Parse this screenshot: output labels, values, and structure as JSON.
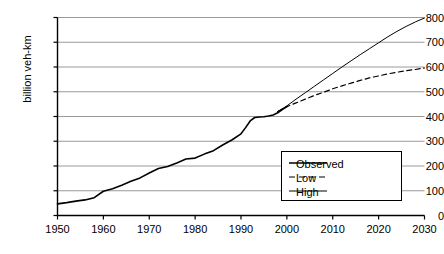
{
  "chart_data": {
    "type": "line",
    "title": "",
    "xlabel": "",
    "ylabel": "billion veh-km",
    "xlim": [
      1950,
      2030
    ],
    "ylim": [
      0,
      800
    ],
    "grid": "horizontal",
    "legend_position": "bottom-right",
    "xticks": [
      "1950",
      "1960",
      "1970",
      "1980",
      "1990",
      "2000",
      "2010",
      "2020",
      "2030"
    ],
    "xtick_values": [
      1950,
      1960,
      1970,
      1980,
      1990,
      2000,
      2010,
      2020,
      2030
    ],
    "yticks": [
      "0",
      "100",
      "200",
      "300",
      "400",
      "500",
      "600",
      "700",
      "800"
    ],
    "ytick_values": [
      0,
      100,
      200,
      300,
      400,
      500,
      600,
      700,
      800
    ],
    "series": [
      {
        "name": "Observed",
        "style": "solid",
        "width": 1.6,
        "color": "#000000",
        "x": [
          1950,
          1952,
          1954,
          1956,
          1958,
          1960,
          1962,
          1964,
          1966,
          1968,
          1970,
          1972,
          1974,
          1976,
          1978,
          1980,
          1982,
          1984,
          1986,
          1988,
          1990,
          1991,
          1992,
          1993,
          1994,
          1995,
          1996,
          1997,
          1998,
          1999,
          2000
        ],
        "values": [
          47,
          52,
          58,
          63,
          72,
          98,
          108,
          122,
          138,
          152,
          172,
          190,
          198,
          212,
          228,
          232,
          248,
          262,
          285,
          305,
          330,
          355,
          382,
          396,
          398,
          399,
          402,
          406,
          415,
          428,
          440
        ]
      },
      {
        "name": "Low",
        "style": "dashed",
        "width": 1.2,
        "color": "#000000",
        "x": [
          1998,
          2000,
          2002,
          2004,
          2006,
          2008,
          2010,
          2012,
          2014,
          2016,
          2018,
          2020,
          2022,
          2024,
          2026,
          2028,
          2030
        ],
        "values": [
          420,
          440,
          455,
          470,
          485,
          498,
          512,
          524,
          535,
          546,
          556,
          564,
          572,
          579,
          585,
          590,
          596
        ]
      },
      {
        "name": "High",
        "style": "solid",
        "width": 1.0,
        "color": "#000000",
        "x": [
          1998,
          2000,
          2002,
          2004,
          2006,
          2008,
          2010,
          2012,
          2014,
          2016,
          2018,
          2020,
          2022,
          2024,
          2026,
          2028,
          2030
        ],
        "values": [
          420,
          443,
          470,
          496,
          522,
          548,
          574,
          600,
          625,
          650,
          674,
          698,
          722,
          744,
          764,
          782,
          798
        ]
      }
    ],
    "legend": [
      {
        "label": "Observed",
        "style": "solid",
        "width": 1.6
      },
      {
        "label": "Low",
        "style": "dashed",
        "width": 1.2
      },
      {
        "label": "High",
        "style": "solid",
        "width": 1.0
      }
    ],
    "colors": {
      "axis": "#000000",
      "gridline": "#808080",
      "background": "#ffffff",
      "line": "#000000"
    }
  }
}
